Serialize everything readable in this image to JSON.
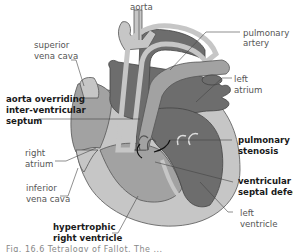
{
  "diagram": {
    "colors": {
      "light_gray": "#c6c6c6",
      "mid_gray": "#a2a2a2",
      "dark_gray": "#6d6d6d",
      "outline": "#444444"
    },
    "labels": {
      "aorta": "aorta",
      "pulmonary_artery_1": "pulmonary",
      "pulmonary_artery_2": "artery",
      "superior_vena_cava_1": "superior",
      "superior_vena_cava_2": "vena cava",
      "left_atrium_1": "left",
      "left_atrium_2": "atrium",
      "aorta_overriding_1": "aorta overriding",
      "aorta_overriding_2": "inter-ventricular",
      "aorta_overriding_3": "septum",
      "pulmonary_stenosis_1": "pulmonary",
      "pulmonary_stenosis_2": "stenosis",
      "right_atrium_1": "right",
      "right_atrium_2": "atrium",
      "vsd_1": "ventricular",
      "vsd_2": "septal defect",
      "inferior_vena_cava_1": "inferior",
      "inferior_vena_cava_2": "vena cava",
      "left_ventricle_1": "left",
      "left_ventricle_2": "ventricle",
      "hypertrophic_rv_1": "hypertrophic",
      "hypertrophic_rv_2": "right ventricle"
    },
    "caption": "Fig. 16.6 Tetralogy of Fallot. The ..."
  }
}
